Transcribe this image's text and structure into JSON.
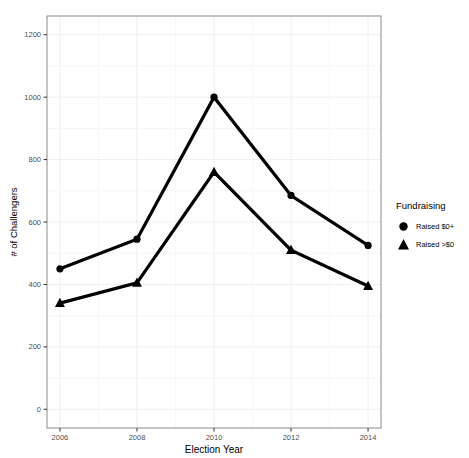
{
  "chart_data": {
    "type": "line",
    "x": [
      2006,
      2008,
      2010,
      2012,
      2014
    ],
    "series": [
      {
        "name": "Raised $0+",
        "marker": "circle",
        "values": [
          450,
          545,
          1000,
          685,
          525
        ]
      },
      {
        "name": "Raised >$0",
        "marker": "triangle",
        "values": [
          340,
          405,
          760,
          510,
          395
        ]
      }
    ],
    "title": "",
    "xlabel": "Election Year",
    "ylabel": "# of Challengers",
    "legend_title": "Fundraising",
    "legend_position": "right",
    "xticks": [
      2006,
      2008,
      2010,
      2012,
      2014
    ],
    "yticks": [
      0,
      200,
      400,
      600,
      800,
      1000,
      1200
    ],
    "xlim": [
      2006,
      2014
    ],
    "ylim": [
      0,
      1200
    ],
    "grid": true,
    "line_color": "#000000"
  },
  "colors": {
    "line": "#000000",
    "panel_border": "#8a8a8a",
    "grid_major": "#efefef",
    "grid_minor": "#f7f7f7",
    "tick_mark": "#333333",
    "tick_label": "#4d4d4d",
    "background": "#ffffff"
  }
}
